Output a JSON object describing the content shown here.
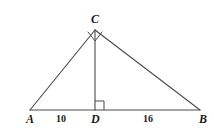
{
  "figure": {
    "type": "geometry-diagram",
    "background_color": "#ffffff",
    "stroke_color": "#4a4a4a",
    "text_color": "#1a1a1a",
    "width": 214,
    "height": 129,
    "points": {
      "A": {
        "label": "A",
        "x": 30,
        "y": 110
      },
      "B": {
        "label": "B",
        "x": 200,
        "y": 110
      },
      "C": {
        "label": "C",
        "x": 95,
        "y": 30
      },
      "D": {
        "label": "D",
        "x": 95,
        "y": 110
      }
    },
    "segments": [
      {
        "name": "AC",
        "from": "A",
        "to": "C"
      },
      {
        "name": "CB",
        "from": "C",
        "to": "B"
      },
      {
        "name": "AB",
        "from": "A",
        "to": "B"
      },
      {
        "name": "CD",
        "from": "C",
        "to": "D"
      }
    ],
    "measures": {
      "AD": "10",
      "DB": "16"
    },
    "right_angles": [
      {
        "at": "C",
        "marker": "diamond"
      },
      {
        "at": "D",
        "marker": "square"
      }
    ]
  }
}
